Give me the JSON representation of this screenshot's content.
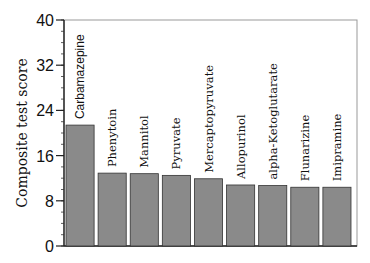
{
  "chart_data": {
    "type": "bar",
    "title": "",
    "xlabel": "",
    "ylabel": "Composite test score",
    "ylim": [
      0,
      40
    ],
    "yticks": [
      0,
      8,
      16,
      24,
      32,
      40
    ],
    "grid": false,
    "legend": null,
    "categories": [
      "Carbamazepine",
      "Phenytoin",
      "Mannitol",
      "Pyruvate",
      "Mercaptopyruvate",
      "Allopurinol",
      "alpha-Ketoglutarate",
      "Flunarizine",
      "Imipramine"
    ],
    "values": [
      21.4,
      12.9,
      12.8,
      12.5,
      11.9,
      10.8,
      10.7,
      10.4,
      10.4
    ],
    "bar_color": "#8a8a8a",
    "label_position": "rotated-above-bar"
  }
}
